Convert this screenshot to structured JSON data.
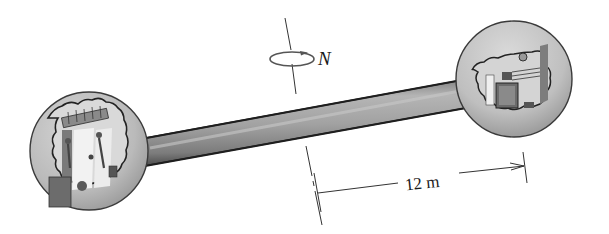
{
  "figure": {
    "rotation_label": "N",
    "dimension_label": "12 m",
    "colors": {
      "sphere_fill": "#bdbdbd",
      "sphere_outline": "#3a3a3a",
      "rod_fill": "#9e9e9e",
      "rod_dark": "#2a2a2a",
      "interior_light": "#e8e8e8",
      "interior_dark": "#6f6f6f",
      "line": "#333333"
    }
  },
  "labels": {
    "rotation_rate": "N",
    "radius_dimension": "12 m"
  }
}
